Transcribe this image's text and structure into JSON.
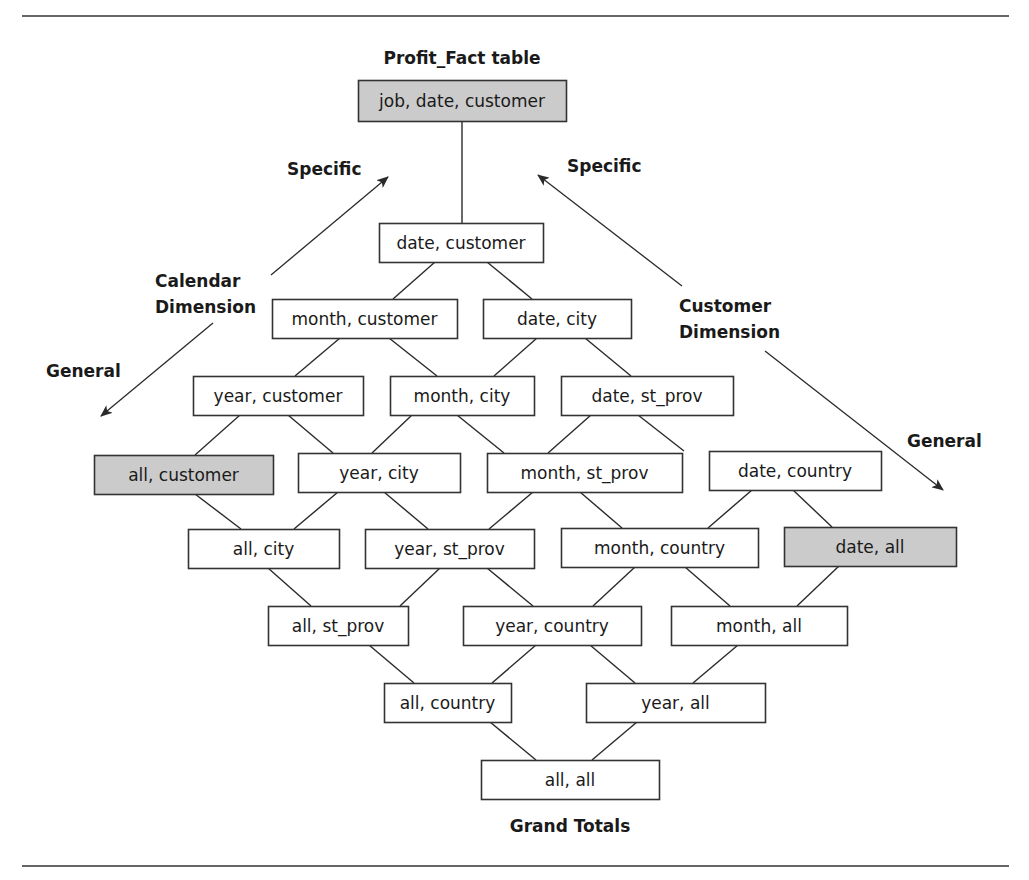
{
  "diagram": {
    "title": "Profit_Fact table",
    "footer": "Grand Totals",
    "colors": {
      "box_fill": "#ffffff",
      "highlight_fill": "#cbcbcb",
      "border": "#333333",
      "text": "#1a1a1a",
      "rule": "#666666"
    },
    "rules": [
      {
        "x1": 22,
        "y1": 16,
        "x2": 1009,
        "y2": 16
      },
      {
        "x1": 22,
        "y1": 866,
        "x2": 1009,
        "y2": 866
      }
    ],
    "nodes": [
      {
        "id": "job_date_customer",
        "label": "job, date, customer",
        "x": 358,
        "y": 80,
        "w": 208,
        "h": 41,
        "highlight": true
      },
      {
        "id": "date_customer",
        "label": "date, customer",
        "x": 379,
        "y": 223,
        "w": 164,
        "h": 39,
        "highlight": false
      },
      {
        "id": "month_customer",
        "label": "month, customer",
        "x": 272,
        "y": 299,
        "w": 185,
        "h": 39,
        "highlight": false
      },
      {
        "id": "date_city",
        "label": "date, city",
        "x": 483,
        "y": 299,
        "w": 148,
        "h": 39,
        "highlight": false
      },
      {
        "id": "year_customer",
        "label": "year, customer",
        "x": 193,
        "y": 376,
        "w": 170,
        "h": 39,
        "highlight": false
      },
      {
        "id": "month_city",
        "label": "month, city",
        "x": 390,
        "y": 376,
        "w": 144,
        "h": 39,
        "highlight": false
      },
      {
        "id": "date_st_prov",
        "label": "date, st_prov",
        "x": 561,
        "y": 376,
        "w": 172,
        "h": 39,
        "highlight": false
      },
      {
        "id": "all_customer",
        "label": "all, customer",
        "x": 94,
        "y": 455,
        "w": 179,
        "h": 39,
        "highlight": true
      },
      {
        "id": "year_city",
        "label": "year, city",
        "x": 298,
        "y": 453,
        "w": 162,
        "h": 39,
        "highlight": false
      },
      {
        "id": "month_st_prov",
        "label": "month, st_prov",
        "x": 487,
        "y": 453,
        "w": 195,
        "h": 39,
        "highlight": false
      },
      {
        "id": "date_country",
        "label": "date, country",
        "x": 709,
        "y": 451,
        "w": 172,
        "h": 39,
        "highlight": false
      },
      {
        "id": "all_city",
        "label": "all, city",
        "x": 188,
        "y": 529,
        "w": 151,
        "h": 39,
        "highlight": false
      },
      {
        "id": "year_st_prov",
        "label": "year, st_prov",
        "x": 365,
        "y": 529,
        "w": 169,
        "h": 39,
        "highlight": false
      },
      {
        "id": "month_country",
        "label": "month, country",
        "x": 561,
        "y": 528,
        "w": 197,
        "h": 39,
        "highlight": false
      },
      {
        "id": "date_all",
        "label": "date, all",
        "x": 784,
        "y": 527,
        "w": 172,
        "h": 39,
        "highlight": true
      },
      {
        "id": "all_st_prov",
        "label": "all, st_prov",
        "x": 268,
        "y": 606,
        "w": 140,
        "h": 39,
        "highlight": false
      },
      {
        "id": "year_country",
        "label": "year, country",
        "x": 463,
        "y": 606,
        "w": 178,
        "h": 39,
        "highlight": false
      },
      {
        "id": "month_all",
        "label": "month, all",
        "x": 671,
        "y": 606,
        "w": 176,
        "h": 39,
        "highlight": false
      },
      {
        "id": "all_country",
        "label": "all, country",
        "x": 384,
        "y": 683,
        "w": 127,
        "h": 39,
        "highlight": false
      },
      {
        "id": "year_all",
        "label": "year, all",
        "x": 586,
        "y": 683,
        "w": 179,
        "h": 39,
        "highlight": false
      },
      {
        "id": "all_all",
        "label": "all, all",
        "x": 481,
        "y": 760,
        "w": 178,
        "h": 39,
        "highlight": false
      }
    ],
    "edges": [
      {
        "x1": 462,
        "y1": 121,
        "x2": 462,
        "y2": 223
      },
      {
        "x1": 435,
        "y1": 262,
        "x2": 393,
        "y2": 299
      },
      {
        "x1": 487,
        "y1": 262,
        "x2": 532,
        "y2": 299
      },
      {
        "x1": 340,
        "y1": 338,
        "x2": 295,
        "y2": 376
      },
      {
        "x1": 389,
        "y1": 338,
        "x2": 437,
        "y2": 376
      },
      {
        "x1": 537,
        "y1": 338,
        "x2": 494,
        "y2": 376
      },
      {
        "x1": 585,
        "y1": 338,
        "x2": 631,
        "y2": 376
      },
      {
        "x1": 240,
        "y1": 415,
        "x2": 195,
        "y2": 455
      },
      {
        "x1": 288,
        "y1": 415,
        "x2": 333,
        "y2": 453
      },
      {
        "x1": 412,
        "y1": 415,
        "x2": 372,
        "y2": 453
      },
      {
        "x1": 457,
        "y1": 415,
        "x2": 504,
        "y2": 453
      },
      {
        "x1": 591,
        "y1": 415,
        "x2": 548,
        "y2": 453
      },
      {
        "x1": 638,
        "y1": 415,
        "x2": 684,
        "y2": 451
      },
      {
        "x1": 195,
        "y1": 494,
        "x2": 241,
        "y2": 529
      },
      {
        "x1": 338,
        "y1": 492,
        "x2": 294,
        "y2": 529
      },
      {
        "x1": 384,
        "y1": 492,
        "x2": 428,
        "y2": 529
      },
      {
        "x1": 533,
        "y1": 492,
        "x2": 489,
        "y2": 529
      },
      {
        "x1": 580,
        "y1": 492,
        "x2": 622,
        "y2": 528
      },
      {
        "x1": 752,
        "y1": 490,
        "x2": 708,
        "y2": 528
      },
      {
        "x1": 793,
        "y1": 490,
        "x2": 832,
        "y2": 527
      },
      {
        "x1": 268,
        "y1": 568,
        "x2": 311,
        "y2": 606
      },
      {
        "x1": 440,
        "y1": 568,
        "x2": 400,
        "y2": 606
      },
      {
        "x1": 487,
        "y1": 568,
        "x2": 533,
        "y2": 606
      },
      {
        "x1": 635,
        "y1": 567,
        "x2": 593,
        "y2": 606
      },
      {
        "x1": 685,
        "y1": 567,
        "x2": 730,
        "y2": 606
      },
      {
        "x1": 839,
        "y1": 566,
        "x2": 797,
        "y2": 606
      },
      {
        "x1": 369,
        "y1": 645,
        "x2": 414,
        "y2": 683
      },
      {
        "x1": 536,
        "y1": 645,
        "x2": 492,
        "y2": 683
      },
      {
        "x1": 590,
        "y1": 645,
        "x2": 635,
        "y2": 683
      },
      {
        "x1": 738,
        "y1": 645,
        "x2": 693,
        "y2": 683
      },
      {
        "x1": 490,
        "y1": 722,
        "x2": 536,
        "y2": 760
      },
      {
        "x1": 637,
        "y1": 722,
        "x2": 592,
        "y2": 760
      }
    ],
    "dimensions": [
      {
        "id": "calendar",
        "lines": [
          "Calendar",
          "Dimension"
        ],
        "label_x": 155,
        "label_y": 287,
        "line_gap": 26,
        "specific": {
          "label": "Specific",
          "x": 287,
          "y": 175
        },
        "general": {
          "label": "General",
          "x": 46,
          "y": 377
        },
        "arrow_specific": {
          "x1": 271,
          "y1": 275,
          "x2": 388,
          "y2": 177
        },
        "arrow_general": {
          "x1": 213,
          "y1": 323,
          "x2": 101,
          "y2": 416
        }
      },
      {
        "id": "customer",
        "lines": [
          "Customer",
          "Dimension"
        ],
        "label_x": 679,
        "label_y": 312,
        "line_gap": 26,
        "specific": {
          "label": "Specific",
          "x": 567,
          "y": 172
        },
        "general": {
          "label": "General",
          "x": 907,
          "y": 447
        },
        "arrow_specific": {
          "x1": 682,
          "y1": 286,
          "x2": 538,
          "y2": 175
        },
        "arrow_general": {
          "x1": 765,
          "y1": 351,
          "x2": 943,
          "y2": 490
        }
      }
    ],
    "title_pos": {
      "x": 462,
      "y": 64
    },
    "footer_pos": {
      "x": 570,
      "y": 832
    }
  }
}
